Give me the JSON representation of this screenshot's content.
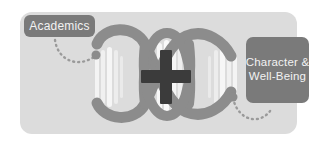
{
  "graphic": {
    "title": "Academics plus Character and Well-Being",
    "colors": {
      "panel_background": "#dcdcdc",
      "page_background": "#ffffff",
      "tag_background": "#7a7a7a",
      "tag_text": "#f2f2f2",
      "helix_strand": "#8c8c8c",
      "rung_light": "#f4f4f4",
      "plus_sign": "#3b3b3b",
      "dotted_connector": "#9a9a9a"
    },
    "tags": [
      {
        "id": "academics",
        "label": "Academics",
        "position": "top-left"
      },
      {
        "id": "character-well-being",
        "label_line_1": "Character &",
        "label_line_2": "Well-Being",
        "position": "right"
      }
    ],
    "center_symbol": {
      "name": "plus-icon",
      "label": "+"
    },
    "helix": {
      "name": "dna-double-helix",
      "strand_count": 2,
      "crossing_count": 3,
      "rung_groups": 3
    },
    "connectors": [
      {
        "id": "academics-connector",
        "style": "dotted-arc",
        "from": "academics",
        "to": "helix-left"
      },
      {
        "id": "character-connector",
        "style": "dotted-arc",
        "from": "helix-right",
        "to": "character-well-being"
      }
    ]
  }
}
